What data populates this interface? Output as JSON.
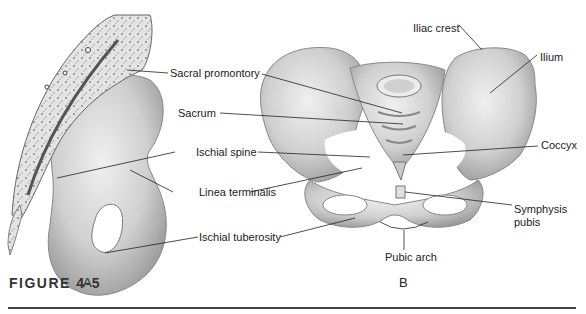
{
  "figure": {
    "caption": "FIGURE 4-5",
    "panels": [
      {
        "id": "A",
        "label": "A"
      },
      {
        "id": "B",
        "label": "B"
      }
    ]
  },
  "labels": {
    "sacral_promontory": "Sacral promontory",
    "sacrum": "Sacrum",
    "ischial_spine": "Ischial spine",
    "linea_terminalis": "Linea terminalis",
    "ischial_tuberosity": "Ischial tuberosity",
    "iliac_crest": "Iliac crest",
    "ilium": "Ilium",
    "coccyx": "Coccyx",
    "symphysis_pubis_line1": "Symphysis",
    "symphysis_pubis_line2": "pubis",
    "pubic_arch": "Pubic arch"
  },
  "colors": {
    "bone_fill": "#d9d9d9",
    "bone_shade": "#a9a9a9",
    "bone_outline": "#777777",
    "leader_line": "#222222",
    "rule": "#444444"
  }
}
